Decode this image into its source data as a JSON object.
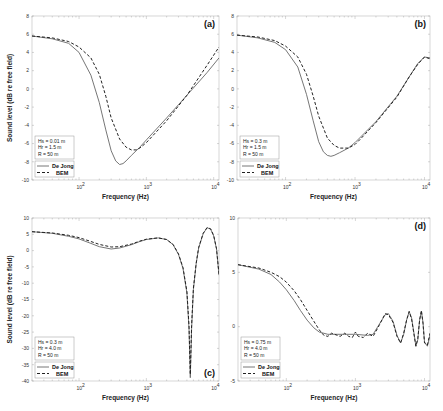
{
  "figure": {
    "xlabel": "Frequency (Hz)",
    "ylabel": "Sound level (dB re free field)",
    "legend": {
      "solid": "De Jong",
      "dashed": "BEM"
    }
  },
  "chart_data": [
    {
      "panel": "(a)",
      "type": "line",
      "xscale": "log",
      "xlim": [
        20,
        12000
      ],
      "ylim": [
        -10,
        8
      ],
      "yticks": [
        -10,
        -8,
        -6,
        -4,
        -2,
        0,
        2,
        4,
        6,
        8
      ],
      "xticks": [
        "10^2",
        "10^3",
        "10^4"
      ],
      "xlabel": "Frequency (Hz)",
      "ylabel": "Sound level (dB re free field)",
      "params": [
        "Hs = 0.01 m",
        "Hr = 1.5 m",
        "R = 50 m"
      ],
      "legend": [
        "De Jong",
        "BEM"
      ],
      "legend_position": "lower left",
      "series": [
        {
          "name": "De Jong",
          "style": "solid",
          "x": [
            20,
            40,
            70,
            100,
            150,
            200,
            250,
            300,
            350,
            400,
            450,
            500,
            600,
            800,
            1000,
            2000,
            4000,
            8000,
            12000
          ],
          "y": [
            5.8,
            5.5,
            5.0,
            4.0,
            1.5,
            -1.5,
            -4.5,
            -6.8,
            -7.9,
            -8.3,
            -8.2,
            -7.9,
            -7.3,
            -6.4,
            -5.6,
            -3.2,
            -0.7,
            1.8,
            3.4
          ]
        },
        {
          "name": "BEM",
          "style": "dashed",
          "x": [
            20,
            40,
            70,
            100,
            150,
            200,
            250,
            300,
            400,
            500,
            600,
            700,
            800,
            1000,
            2000,
            4000,
            8000,
            12000
          ],
          "y": [
            5.8,
            5.6,
            5.2,
            4.6,
            3.4,
            1.6,
            -0.8,
            -3.2,
            -5.5,
            -6.4,
            -6.7,
            -6.7,
            -6.5,
            -5.9,
            -3.5,
            -0.7,
            2.6,
            4.6
          ]
        }
      ]
    },
    {
      "panel": "(b)",
      "type": "line",
      "xscale": "log",
      "xlim": [
        20,
        12000
      ],
      "ylim": [
        -10,
        8
      ],
      "yticks": [
        -10,
        -8,
        -6,
        -4,
        -2,
        0,
        2,
        4,
        6,
        8
      ],
      "xticks": [
        "10^2",
        "10^3",
        "10^4"
      ],
      "xlabel": "Frequency (Hz)",
      "ylabel": "",
      "params": [
        "Hs = 0.3 m",
        "Hr = 1.5 m",
        "R = 50 m"
      ],
      "legend": [
        "De Jong",
        "BEM"
      ],
      "legend_position": "lower left",
      "series": [
        {
          "name": "De Jong",
          "style": "solid",
          "x": [
            20,
            40,
            70,
            100,
            150,
            200,
            250,
            300,
            350,
            400,
            450,
            500,
            600,
            800,
            1000,
            2000,
            4000,
            6000,
            8000,
            10000,
            12000
          ],
          "y": [
            5.9,
            5.6,
            5.1,
            4.3,
            2.4,
            -0.6,
            -3.5,
            -5.8,
            -6.9,
            -7.3,
            -7.4,
            -7.3,
            -7.0,
            -6.5,
            -5.9,
            -3.6,
            -0.8,
            1.3,
            2.8,
            3.5,
            3.4
          ]
        },
        {
          "name": "BEM",
          "style": "dashed",
          "x": [
            20,
            40,
            70,
            100,
            150,
            200,
            250,
            300,
            400,
            500,
            600,
            700,
            800,
            1000,
            1200,
            2000,
            4000,
            6000,
            8000,
            10000,
            12000
          ],
          "y": [
            5.9,
            5.7,
            5.3,
            4.7,
            3.5,
            1.6,
            -0.8,
            -3.0,
            -5.4,
            -6.2,
            -6.5,
            -6.5,
            -6.5,
            -6.1,
            -5.5,
            -3.7,
            -0.9,
            1.3,
            2.7,
            3.5,
            3.3
          ]
        }
      ]
    },
    {
      "panel": "(c)",
      "type": "line",
      "xscale": "log",
      "xlim": [
        20,
        12000
      ],
      "ylim": [
        -40,
        10
      ],
      "yticks": [
        -40,
        -35,
        -30,
        -25,
        -20,
        -15,
        -10,
        -5,
        0,
        5,
        10
      ],
      "xticks": [
        "10^2",
        "10^3",
        "10^4"
      ],
      "xlabel": "Frequency (Hz)",
      "ylabel": "Sound level (dB re free field)",
      "params": [
        "Hs = 0.3 m",
        "Hr = 4.0 m",
        "R = 50 m"
      ],
      "legend": [
        "De Jong",
        "BEM"
      ],
      "legend_position": "lower left",
      "series": [
        {
          "name": "De Jong",
          "style": "solid",
          "x": [
            20,
            40,
            70,
            100,
            150,
            200,
            300,
            400,
            600,
            800,
            1000,
            1500,
            2000,
            2500,
            3000,
            3500,
            4000,
            4300,
            4500,
            4700,
            5000,
            5500,
            6000,
            7000,
            8000,
            9000,
            10000,
            11000,
            12000
          ],
          "y": [
            5.8,
            5.3,
            4.4,
            3.6,
            2.2,
            1.2,
            0.5,
            0.8,
            1.8,
            2.8,
            3.4,
            3.9,
            3.4,
            1.8,
            -1.2,
            -5.5,
            -13,
            -24,
            -39,
            -24,
            -12,
            -4,
            0.8,
            5.2,
            7.0,
            6.6,
            4.5,
            0.5,
            -7.5
          ]
        },
        {
          "name": "BEM",
          "style": "dashed",
          "x": [
            20,
            40,
            70,
            100,
            150,
            200,
            300,
            400,
            600,
            800,
            1000,
            1500,
            2000,
            2500,
            3000,
            3500,
            4000,
            4300,
            4500,
            4700,
            5000,
            5500,
            6000,
            7000,
            8000,
            9000,
            10000,
            11000,
            12000
          ],
          "y": [
            5.8,
            5.4,
            4.7,
            4.0,
            2.8,
            1.9,
            1.1,
            1.2,
            2.0,
            2.9,
            3.5,
            3.9,
            3.4,
            1.9,
            -1.0,
            -5.2,
            -12.5,
            -23,
            -38,
            -23,
            -11.5,
            -3.8,
            1.0,
            5.3,
            7.1,
            6.7,
            4.6,
            0.6,
            -7.2
          ]
        }
      ]
    },
    {
      "panel": "(d)",
      "type": "line",
      "xscale": "log",
      "xlim": [
        20,
        12000
      ],
      "ylim": [
        -5,
        10
      ],
      "yticks": [
        -5,
        0,
        5,
        10
      ],
      "xticks": [
        "10^2",
        "10^3",
        "10^4"
      ],
      "xlabel": "Frequency (Hz)",
      "ylabel": "",
      "params": [
        "Hs = 0.75 m",
        "Hr = 4.0 m",
        "R = 50 m"
      ],
      "legend": [
        "De Jong",
        "BEM"
      ],
      "legend_position": "lower left",
      "series": [
        {
          "name": "De Jong",
          "style": "solid",
          "x": [
            20,
            40,
            60,
            80,
            100,
            130,
            160,
            200,
            250,
            300,
            400,
            500,
            700,
            1000,
            1500,
            1800,
            2200,
            2700,
            3000,
            3500,
            4000,
            4500,
            5000,
            5500,
            6000,
            6500,
            7000,
            7500,
            8000,
            8500,
            9000,
            9500,
            10000,
            11000,
            12000
          ],
          "y": [
            5.7,
            5.3,
            4.8,
            4.1,
            3.4,
            2.4,
            1.5,
            0.6,
            -0.1,
            -0.5,
            -0.7,
            -0.7,
            -0.7,
            -0.7,
            -0.8,
            -0.7,
            0.2,
            1.1,
            1.2,
            0.5,
            -0.8,
            -1.5,
            -0.7,
            0.6,
            1.4,
            0.8,
            -0.5,
            -1.8,
            -1.2,
            0.6,
            1.4,
            0.4,
            -1.4,
            -1.8,
            -0.8
          ]
        },
        {
          "name": "BEM",
          "style": "dashed",
          "x": [
            20,
            40,
            60,
            80,
            100,
            130,
            160,
            200,
            250,
            300,
            350,
            400,
            450,
            500,
            600,
            700,
            800,
            900,
            1000,
            1100,
            1300,
            1500,
            1800,
            2200,
            2700,
            3000,
            3500,
            4000,
            4500,
            5000,
            5500,
            6000,
            6500,
            7000,
            7500,
            8000,
            8500,
            9000,
            9500,
            10000,
            11000,
            12000
          ],
          "y": [
            5.7,
            5.4,
            5.0,
            4.6,
            4.1,
            3.3,
            2.5,
            1.5,
            0.5,
            -0.3,
            -0.8,
            -0.9,
            -0.6,
            -0.7,
            -0.9,
            -0.6,
            -0.9,
            -1.0,
            -0.5,
            -0.9,
            -1.0,
            -0.6,
            -0.9,
            0.1,
            1.2,
            1.1,
            0.4,
            -0.9,
            -1.5,
            -0.6,
            0.6,
            1.4,
            0.7,
            -0.6,
            -1.8,
            -1.1,
            0.6,
            1.5,
            0.3,
            -1.5,
            -1.7,
            -0.6
          ]
        }
      ]
    }
  ]
}
